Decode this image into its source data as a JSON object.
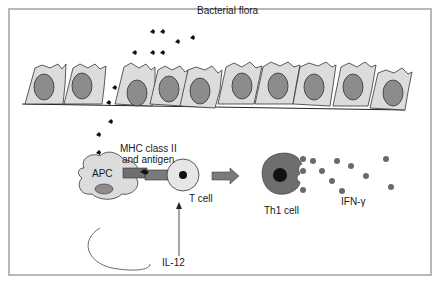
{
  "diagram": {
    "labels": {
      "bacterial_flora": "Bacterial flora",
      "mhc_line1": "MHC class II",
      "mhc_line2": "and antigen",
      "apc": "APC",
      "t_cell": "T cell",
      "th1_cell": "Th1 cell",
      "ifn": "IFN-γ",
      "il12": "IL-12"
    },
    "colors": {
      "cell_fill": "#dcdcdc",
      "nucleus_fill": "#8c8c8c",
      "th1_fill": "#6e6e6e",
      "arrow_fill": "#7a7a7a",
      "frame_border": "#b8b8b8",
      "dot_fill": "#6a6a6a"
    },
    "epithelial_cell_count": 10
  }
}
